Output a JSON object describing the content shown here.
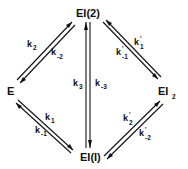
{
  "diagram": {
    "type": "kinetic-reaction-scheme",
    "nodes": {
      "E": {
        "label": "E",
        "sub": ""
      },
      "EI2_top": {
        "label": "EI(2)",
        "sub": ""
      },
      "EI2_right": {
        "label": "EI",
        "sub": "2"
      },
      "EI1": {
        "label": "EI(I)",
        "sub": ""
      }
    },
    "edges": [
      {
        "from": "E",
        "to": "EI(2)",
        "forward": {
          "k": "k",
          "sub": "2"
        },
        "reverse": {
          "k": "k",
          "sub": "-2"
        }
      },
      {
        "from": "EI(2)",
        "to": "EI2",
        "forward": {
          "k": "k'",
          "sub": "1"
        },
        "reverse": {
          "k": "k'",
          "sub": "-1"
        }
      },
      {
        "from": "E",
        "to": "EI(I)",
        "forward": {
          "k": "k",
          "sub": "1"
        },
        "reverse": {
          "k": "k",
          "sub": "-1"
        }
      },
      {
        "from": "EI(I)",
        "to": "EI(2)",
        "forward": {
          "k": "k",
          "sub": "3"
        },
        "reverse": {
          "k": "k",
          "sub": "-3"
        }
      },
      {
        "from": "EI(I)",
        "to": "EI2",
        "forward": {
          "k": "k'",
          "sub": "2"
        },
        "reverse": {
          "k": "k'",
          "sub": "-2"
        }
      }
    ],
    "labels": {
      "k2": {
        "base": "k",
        "sub": "2"
      },
      "km2": {
        "base": "k",
        "sub": "-2"
      },
      "k1p": {
        "base": "k",
        "sup": "'",
        "sub": "1"
      },
      "km1p": {
        "base": "k",
        "sup": "'",
        "sub": "-1"
      },
      "k1": {
        "base": "k",
        "sub": "1"
      },
      "km1": {
        "base": "k",
        "sub": "-1"
      },
      "k3": {
        "base": "k",
        "sub": "3"
      },
      "km3": {
        "base": "k",
        "sub": "-3"
      },
      "k2p": {
        "base": "k",
        "sup": "'",
        "sub": "2"
      },
      "km2p": {
        "base": "k",
        "sup": "'",
        "sub": "-2"
      }
    },
    "colors": {
      "ink": "#111111",
      "background": "#ffffff"
    }
  }
}
